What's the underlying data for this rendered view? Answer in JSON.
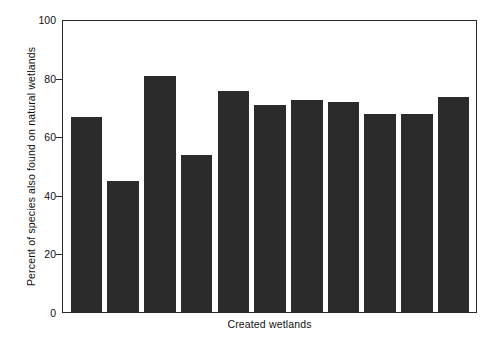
{
  "chart_data": {
    "type": "bar",
    "title": "",
    "xlabel": "Created wetlands",
    "ylabel": "Percent of species also found on natural wetlands",
    "categories": [
      "1",
      "2",
      "3",
      "4",
      "5",
      "6",
      "7",
      "8",
      "9",
      "10",
      "11"
    ],
    "values": [
      67,
      45,
      81,
      54,
      76,
      71,
      73,
      72,
      68,
      68,
      74
    ],
    "ylim": [
      0,
      100
    ],
    "yticks": [
      0,
      20,
      40,
      60,
      80,
      100
    ],
    "ytick_labels": [
      "0",
      "20",
      "40",
      "60",
      "80",
      "100"
    ],
    "xtick_labels": [],
    "grid": false,
    "legend": false,
    "bar_color": "#2b2b2b",
    "background_color": "#ffffff",
    "axis_color": "#2a2a2a"
  }
}
